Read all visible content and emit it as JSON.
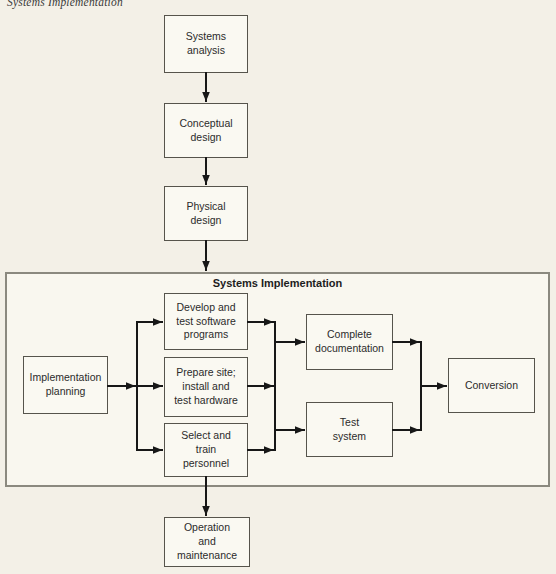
{
  "page": {
    "header": "Systems Implementation"
  },
  "diagram": {
    "container_title": "Systems Implementation",
    "nodes": {
      "systems_analysis": "Systems\nanalysis",
      "conceptual_design": "Conceptual\ndesign",
      "physical_design": "Physical\ndesign",
      "implementation_planning": "Implementation\nplanning",
      "develop_software": "Develop and\ntest software\nprograms",
      "prepare_site": "Prepare site;\ninstall and\ntest hardware",
      "select_personnel": "Select and\ntrain\npersonnel",
      "complete_documentation": "Complete\ndocumentation",
      "test_system": "Test\nsystem",
      "conversion": "Conversion",
      "operation_maintenance": "Operation\nand\nmaintenance"
    },
    "edges": [
      {
        "from": "systems_analysis",
        "to": "conceptual_design"
      },
      {
        "from": "conceptual_design",
        "to": "physical_design"
      },
      {
        "from": "physical_design",
        "to": "systems_implementation_container"
      },
      {
        "from": "implementation_planning",
        "to": "develop_software"
      },
      {
        "from": "implementation_planning",
        "to": "prepare_site"
      },
      {
        "from": "implementation_planning",
        "to": "select_personnel"
      },
      {
        "from": "develop_software",
        "to": "complete_documentation"
      },
      {
        "from": "develop_software",
        "to": "test_system"
      },
      {
        "from": "prepare_site",
        "to": "complete_documentation"
      },
      {
        "from": "prepare_site",
        "to": "test_system"
      },
      {
        "from": "select_personnel",
        "to": "complete_documentation"
      },
      {
        "from": "select_personnel",
        "to": "test_system"
      },
      {
        "from": "complete_documentation",
        "to": "conversion"
      },
      {
        "from": "test_system",
        "to": "conversion"
      },
      {
        "from": "systems_implementation_container",
        "to": "operation_maintenance"
      }
    ]
  },
  "colors": {
    "page_bg": "#f3f0e7",
    "container_bg": "#f9f7ef",
    "node_bg": "#faf9f2",
    "node_border": "#56544c",
    "container_border": "#8b897f",
    "arrow": "#171717",
    "text": "#2b2b2b"
  }
}
